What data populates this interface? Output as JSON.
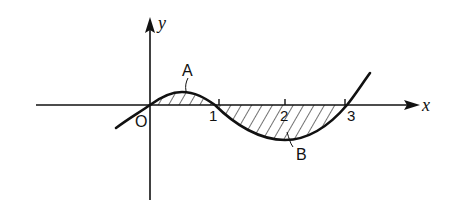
{
  "diagram": {
    "type": "function-graph",
    "axes": {
      "x_label": "x",
      "y_label": "y",
      "origin_label": "O",
      "ticks": [
        {
          "value": 1,
          "label": "1"
        },
        {
          "value": 2,
          "label": "2"
        },
        {
          "value": 3,
          "label": "3"
        }
      ]
    },
    "regions": [
      {
        "id": "A",
        "label": "A",
        "interval": [
          0,
          1
        ],
        "position": "above x-axis",
        "hatched": true
      },
      {
        "id": "B",
        "label": "B",
        "interval": [
          1,
          3
        ],
        "position": "below x-axis",
        "hatched": true
      }
    ],
    "curve": {
      "roots": [
        0,
        1,
        3
      ],
      "description": "cubic y = x(x-1)(x-3)"
    },
    "colors": {
      "ink": "#111111",
      "background": "#ffffff"
    }
  }
}
